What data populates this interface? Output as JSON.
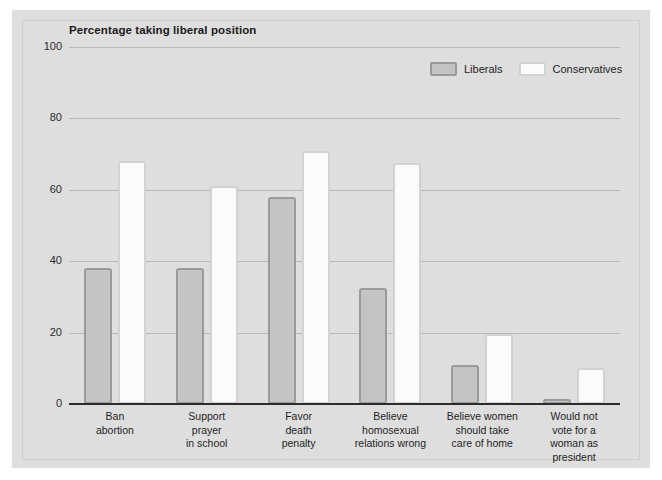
{
  "chart_data": {
    "type": "bar",
    "title": "Percentage taking liberal position",
    "xlabel": "",
    "ylabel": "",
    "ylim": [
      0,
      100
    ],
    "yticks": [
      0,
      20,
      40,
      60,
      80,
      100
    ],
    "grid": true,
    "legend_position": "top-right",
    "categories": [
      "Ban\nabortion",
      "Support\nprayer\nin school",
      "Favor\ndeath\npenalty",
      "Believe\nhomosexual\nrelations wrong",
      "Believe women\nshould take\ncare of home",
      "Would not\nvote for a\nwoman as\npresident"
    ],
    "series": [
      {
        "name": "Liberals",
        "color": "#c4c4c4",
        "values": [
          38,
          38,
          58,
          32.5,
          11,
          1.5
        ]
      },
      {
        "name": "Conservatives",
        "color": "#fbfbfb",
        "values": [
          68,
          61,
          71,
          67.5,
          19.5,
          10
        ]
      }
    ]
  },
  "colors": {
    "panel_background": "#dedede",
    "page_background": "#ffffff",
    "gridline": "#b9b9b9",
    "axis": "#2c2c2c",
    "liberals_fill": "#c4c4c4",
    "liberals_border": "#9a9a9a",
    "conservatives_fill": "#fbfbfb",
    "conservatives_border": "#d2d2d2",
    "text": "#1f1f1f"
  }
}
